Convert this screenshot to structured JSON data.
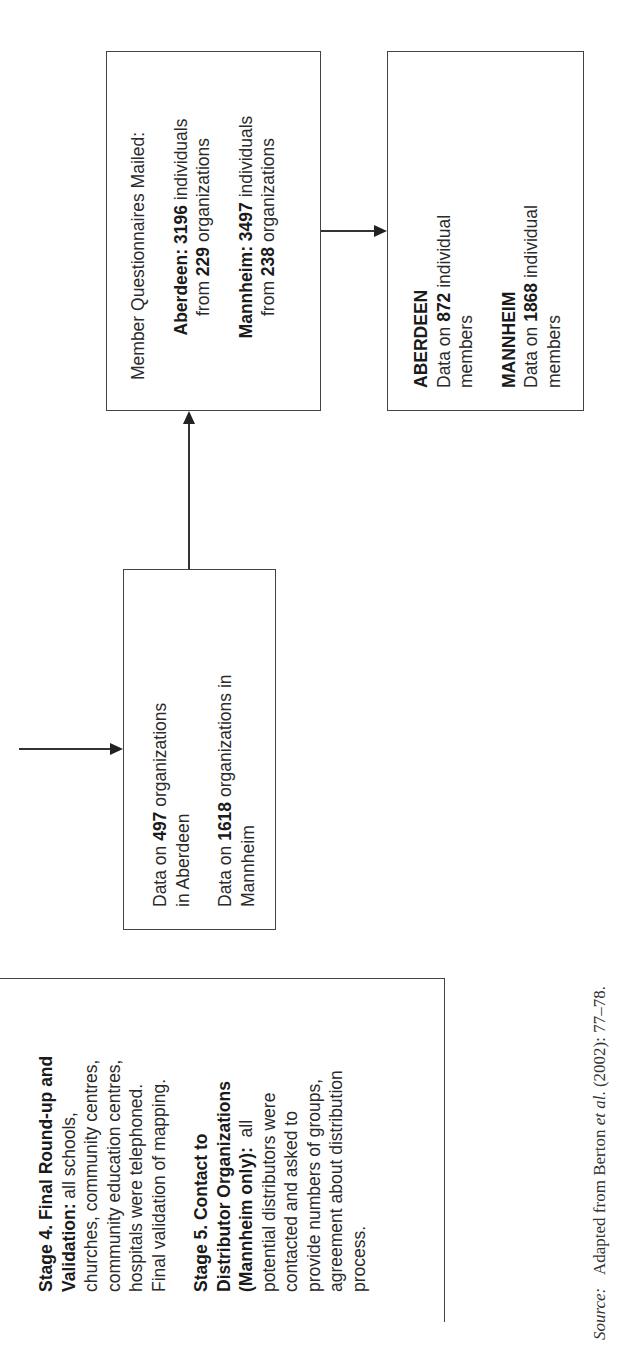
{
  "stages_box": {
    "stage4": {
      "heading": "Stage 4. Final Round-up and Validation:",
      "body_lines": [
        "all schools,",
        "churches, community centres,",
        "community education centres,",
        "hospitals were telephoned.",
        "Final validation of mapping."
      ]
    },
    "stage5": {
      "heading_line1": "Stage 5. Contact to",
      "heading_line2": "Distributor Organizations",
      "heading_line3": "(Mannheim only):",
      "body_first": "all",
      "body_lines": [
        "potential distributors were",
        "contacted and asked to",
        "provide numbers of groups,",
        "agreement about distribution",
        "process."
      ]
    }
  },
  "organizations_box": {
    "aberdeen": {
      "prefix": "Data on ",
      "count": "497",
      "suffix": " organizations",
      "line2": "in Aberdeen"
    },
    "mannheim": {
      "prefix": "Data on ",
      "count": "1618",
      "suffix": " organizations in",
      "line2": "Mannheim"
    }
  },
  "questionnaires_box": {
    "title": "Member Questionnaires Mailed:",
    "aberdeen": {
      "label": "Aberdeen:",
      "individuals": "3196",
      "individuals_suffix": " individuals",
      "from_prefix": "from ",
      "organizations": "229",
      "organizations_suffix": " organizations"
    },
    "mannheim": {
      "label": "Mannheim:",
      "individuals": "3497",
      "individuals_suffix": " individuals",
      "from_prefix": "from ",
      "organizations": "238",
      "organizations_suffix": " organizations"
    }
  },
  "members_box": {
    "aberdeen": {
      "label": "ABERDEEN",
      "prefix": "Data on ",
      "count": "872",
      "suffix": " individual",
      "line2": "members"
    },
    "mannheim": {
      "label": "MANNHEIM",
      "prefix": "Data on ",
      "count": "1868",
      "suffix": " individual",
      "line2": "members"
    }
  },
  "source": {
    "label": "Source:",
    "text_before": "Adapted from Berton ",
    "et_al": "et al",
    "text_after": ". (2002): 77–78."
  }
}
